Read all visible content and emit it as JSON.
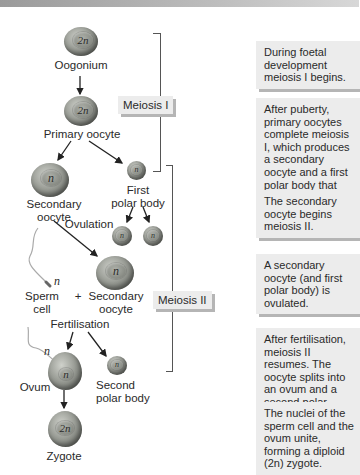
{
  "diagram": {
    "phases": {
      "meiosis1": "Meiosis I",
      "meiosis2": "Meiosis II"
    },
    "cells": {
      "oogonium": {
        "label": "Oogonium",
        "ploidy": "2n"
      },
      "primary_oocyte": {
        "label": "Primary oocyte",
        "ploidy": "2n"
      },
      "secondary_oocyte_1": {
        "label_line1": "Secondary",
        "label_line2": "oocyte",
        "ploidy": "n"
      },
      "first_polar_body": {
        "label_line1": "First",
        "label_line2": "polar body",
        "ploidy": "n"
      },
      "polar_body_a": {
        "ploidy": "n"
      },
      "polar_body_b": {
        "ploidy": "n"
      },
      "sperm": {
        "label_line1": "Sperm",
        "label_line2": "cell",
        "ploidy": "n"
      },
      "plus": "+",
      "secondary_oocyte_2": {
        "label_line1": "Secondary",
        "label_line2": "oocyte",
        "ploidy": "n"
      },
      "ovum": {
        "label": "Ovum",
        "ploidy": "n",
        "sperm_ploidy": "n"
      },
      "second_polar_body": {
        "label_line1": "Second",
        "label_line2": "polar body",
        "ploidy": "n"
      },
      "zygote": {
        "label": "Zygote",
        "ploidy": "2n"
      }
    },
    "events": {
      "ovulation": "Ovulation",
      "fertilisation": "Fertilisation"
    },
    "notes": [
      "During foetal development meiosis I begins.",
      "After puberty, primary oocytes complete meiosis I, which produces a secondary oocyte and a first polar body that may or may not divide again.",
      "The secondary oocyte begins meiosis II.",
      "A secondary oocyte (and first polar body) is ovulated.",
      "After fertilisation, meiosis II resumes. The oocyte splits into an ovum and a second polar body.",
      "The nuclei of the sperm cell and the ovum unite, forming a diploid (2n) zygote."
    ],
    "colors": {
      "cell": "#8f928b",
      "box_bg": "#ececec",
      "box_shadow": "#b5b5b5",
      "bracket": "#555555"
    }
  }
}
